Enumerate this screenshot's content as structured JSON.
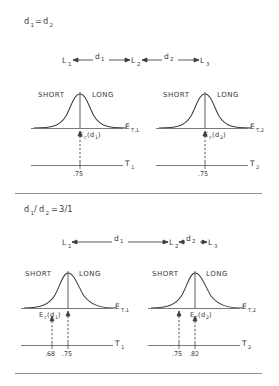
{
  "figure": {
    "type": "diagram",
    "divider_color": "#8f8f8f"
  },
  "sections": [
    {
      "id": "equal",
      "condition_label": "d",
      "condition": {
        "lhs_base": "d",
        "lhs_sub": "1",
        "operator": "=",
        "rhs_base": "d",
        "rhs_sub": "2",
        "full": "d1 = d2"
      },
      "route": {
        "nodes": [
          {
            "base": "L",
            "sub": "1"
          },
          {
            "base": "L",
            "sub": "2"
          },
          {
            "base": "L",
            "sub": "3"
          }
        ],
        "segments": [
          {
            "base": "d",
            "sub": "1",
            "relative_length": "1"
          },
          {
            "base": "d",
            "sub": "2",
            "relative_length": "1"
          }
        ]
      },
      "panels": [
        {
          "id": "left",
          "left_category": "SHORT",
          "right_category": "LONG",
          "dist_axis": {
            "base": "E",
            "sub": "T,1"
          },
          "time_axis": {
            "base": "T",
            "sub": "1"
          },
          "criterion": {
            "base": "E",
            "sub_c": "c",
            "arg_base": "d",
            "arg_sub": "1",
            "full": "Ec(d1)"
          },
          "ticks": [
            ".75"
          ],
          "criterion_tick": ".75",
          "peak_tick": ".75",
          "peak_offset": "0"
        },
        {
          "id": "right",
          "left_category": "SHORT",
          "right_category": "LONG",
          "dist_axis": {
            "base": "E",
            "sub": "T,2"
          },
          "time_axis": {
            "base": "T",
            "sub": "2"
          },
          "criterion": {
            "base": "E",
            "sub_c": "c",
            "arg_base": "d",
            "arg_sub": "2",
            "full": "Ec(d2)"
          },
          "ticks": [
            ".75"
          ],
          "criterion_tick": ".75",
          "peak_tick": ".75",
          "peak_offset": "0"
        }
      ]
    },
    {
      "id": "unequal",
      "condition": {
        "lhs_base": "d",
        "lhs_sub": "1",
        "slash": "/",
        "mid_base": "d",
        "mid_sub": "2",
        "operator": "=",
        "value": "3/1",
        "full": "d1/d2 = 3/1"
      },
      "route": {
        "nodes": [
          {
            "base": "L",
            "sub": "1"
          },
          {
            "base": "L",
            "sub": "2"
          },
          {
            "base": "L",
            "sub": "3"
          }
        ],
        "segments": [
          {
            "base": "d",
            "sub": "1",
            "relative_length": "3"
          },
          {
            "base": "d",
            "sub": "2",
            "relative_length": "1"
          }
        ]
      },
      "panels": [
        {
          "id": "left",
          "left_category": "SHORT",
          "right_category": "LONG",
          "dist_axis": {
            "base": "E",
            "sub": "T,1"
          },
          "time_axis": {
            "base": "T",
            "sub": "1"
          },
          "criterion": {
            "base": "E",
            "sub_c": "c",
            "arg_base": "d",
            "arg_sub": "1",
            "full": "Ec(d1)"
          },
          "ticks": [
            ".68",
            ".75"
          ],
          "criterion_tick": ".68",
          "peak_tick": ".75",
          "peak_offset": "left"
        },
        {
          "id": "right",
          "left_category": "SHORT",
          "right_category": "LONG",
          "dist_axis": {
            "base": "E",
            "sub": "T,2"
          },
          "time_axis": {
            "base": "T",
            "sub": "2"
          },
          "criterion": {
            "base": "E",
            "sub_c": "c",
            "arg_base": "d",
            "arg_sub": "2",
            "full": "Ec(d2)"
          },
          "ticks": [
            ".75",
            ".82"
          ],
          "criterion_tick": ".82",
          "peak_tick": ".82",
          "peak_offset": "right"
        }
      ]
    }
  ]
}
